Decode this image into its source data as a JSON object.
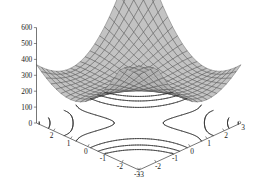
{
  "figure": {
    "title": "",
    "background_color": "#ffffff",
    "surface_color": "#b4b4b4",
    "mesh_color": "#4a4a4a",
    "contour_color": "#2b2b2b",
    "axis_color": "#3c3c3c",
    "tick_label_color": "#1a1a1a"
  },
  "chart_data": {
    "type": "line",
    "subtype": "surface3d-with-contour-projection",
    "title": "",
    "xlabel": "",
    "ylabel": "",
    "zlabel": "",
    "grid": true,
    "legend": "none",
    "projection": "3d",
    "xlim": [
      -3,
      3
    ],
    "ylim": [
      -3,
      3
    ],
    "zlim": [
      0,
      600
    ],
    "x_ticks": [
      -3,
      -2,
      -1,
      0,
      1,
      2,
      3
    ],
    "x_tick_labels": [
      "-3",
      "-2",
      "-1",
      "0",
      "1",
      "2",
      "3"
    ],
    "y_ticks": [
      2,
      1,
      0,
      -1,
      -2,
      -3
    ],
    "y_tick_labels": [
      "2",
      "1",
      "0",
      "-1",
      "-2",
      "-3"
    ],
    "z_ticks": [
      0,
      100,
      200,
      300,
      400,
      500,
      600
    ],
    "z_tick_labels": [
      "0",
      "100",
      "200",
      "300",
      "400",
      "500",
      "600"
    ],
    "surface_mesh_n": 21,
    "contour_levels": [
      50,
      100,
      150,
      200,
      250,
      300,
      350,
      400
    ],
    "surface_corner_values": {
      "back": 600,
      "left": 260,
      "right": 260,
      "front": 150,
      "center": 280
    }
  },
  "z_axis": {
    "ticks": [
      {
        "label": "600",
        "value": 600
      },
      {
        "label": "500",
        "value": 500
      },
      {
        "label": "400",
        "value": 400
      },
      {
        "label": "300",
        "value": 300
      },
      {
        "label": "200",
        "value": 200
      },
      {
        "label": "100",
        "value": 100
      },
      {
        "label": "0",
        "value": 0
      }
    ]
  },
  "y_axis": {
    "ticks": [
      {
        "label": "2",
        "value": 2
      },
      {
        "label": "1",
        "value": 1
      },
      {
        "label": "0",
        "value": 0
      },
      {
        "label": "-1",
        "value": -1
      },
      {
        "label": "-2",
        "value": -2
      },
      {
        "label": "-3",
        "value": -3
      }
    ]
  },
  "x_axis": {
    "ticks": [
      {
        "label": "-3",
        "value": -3
      },
      {
        "label": "-2",
        "value": -2
      },
      {
        "label": "-1",
        "value": -1
      },
      {
        "label": "0",
        "value": 0
      },
      {
        "label": "1",
        "value": 1
      },
      {
        "label": "2",
        "value": 2
      },
      {
        "label": "3",
        "value": 3
      }
    ]
  }
}
